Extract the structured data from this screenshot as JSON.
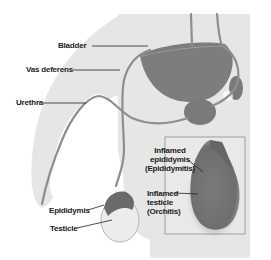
{
  "diagram": {
    "colors": {
      "background": "#ffffff",
      "body_silhouette": "#e6e6e6",
      "inset_background": "#e9e9e9",
      "inset_border": "#8c8c8c",
      "organ_fill": "#7d7d7d",
      "organ_dark": "#6a6a6a",
      "tube_stroke": "#8e8e8e",
      "testicle_fill": "#ececec",
      "label_text": "#1a1a1a",
      "leader_line": "#222222"
    },
    "labels": {
      "bladder": "Bladder",
      "vas_deferens": "Vas deferens",
      "urethra": "Urethra",
      "epididymis": "Epididymis",
      "testicle": "Testicle",
      "inflamed_epididymis": [
        "Inflamed",
        "epididymis",
        "(Epididymitis)"
      ],
      "inflamed_testicle": [
        "Inflamed",
        "testicle",
        "(Orchitis)"
      ]
    }
  }
}
